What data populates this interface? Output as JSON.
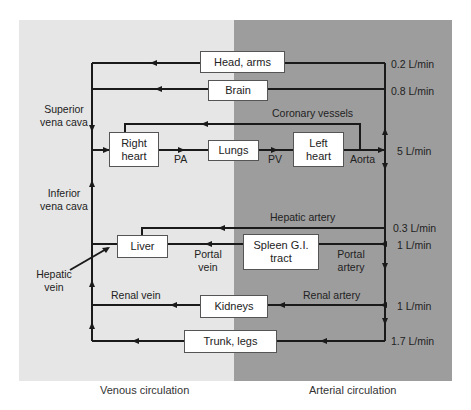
{
  "diagram": {
    "regions": {
      "venous": {
        "caption": "Venous circulation",
        "color": "#e6e6e6"
      },
      "arterial": {
        "caption": "Arterial circulation",
        "color": "#9d9d9d"
      }
    },
    "boxes": {
      "head_arms": "Head, arms",
      "brain": "Brain",
      "right_heart": "Right heart",
      "lungs": "Lungs",
      "left_heart": "Left heart",
      "liver": "Liver",
      "spleen_gi": "Spleen G.I. tract",
      "kidneys": "Kidneys",
      "trunk_legs": "Trunk, legs"
    },
    "vessel_labels": {
      "superior_vena_cava_1": "Superior",
      "superior_vena_cava_2": "vena cava",
      "inferior_vena_cava_1": "Inferior",
      "inferior_vena_cava_2": "vena cava",
      "hepatic_vein_1": "Hepatic",
      "hepatic_vein_2": "vein",
      "coronary_vessels": "Coronary vessels",
      "pa": "PA",
      "pv": "PV",
      "aorta": "Aorta",
      "hepatic_artery": "Hepatic artery",
      "portal_vein_1": "Portal",
      "portal_vein_2": "vein",
      "portal_artery_1": "Portal",
      "portal_artery_2": "artery",
      "renal_vein": "Renal vein",
      "renal_artery": "Renal artery"
    },
    "flows": {
      "head_arms": "0.2 L/min",
      "brain": "0.8 L/min",
      "cardiac_output": "5 L/min",
      "hepatic_artery": "0.3 L/min",
      "spleen_gi": "1 L/min",
      "kidneys": "1 L/min",
      "trunk_legs": "1.7 L/min"
    },
    "line_color": "#1a1a1a"
  }
}
